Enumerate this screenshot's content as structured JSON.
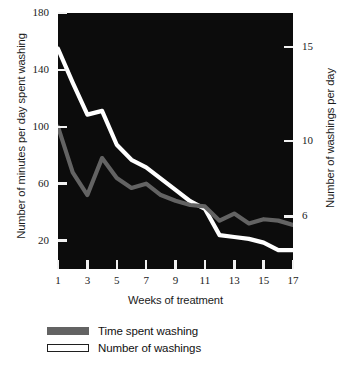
{
  "chart_data": {
    "type": "line",
    "title": "",
    "xlabel": "Weeks of treatment",
    "ylabel": "Number of minutes per day spent washing",
    "ylabel_right": "Number of washings per day",
    "grid": false,
    "legend_position": "bottom-left",
    "background": "#0c0c0c",
    "x": [
      1,
      2,
      3,
      4,
      5,
      6,
      7,
      8,
      9,
      10,
      11,
      12,
      13,
      14,
      15,
      16,
      17
    ],
    "xticks": [
      1,
      3,
      5,
      7,
      9,
      11,
      13,
      15,
      17
    ],
    "xlim": [
      1,
      17
    ],
    "ylim_left": [
      0,
      180
    ],
    "yticks_left": [
      20,
      60,
      100,
      140,
      180
    ],
    "ylim_right": [
      3.2,
      16.8
    ],
    "yticks_right": [
      6,
      10,
      15
    ],
    "series": [
      {
        "name": "Time spent washing",
        "axis": "left",
        "color": "#636363",
        "unit": "minutes per day",
        "values": [
          100,
          68,
          52,
          78,
          64,
          57,
          60,
          52,
          48,
          45,
          44,
          34,
          39,
          32,
          35,
          34,
          31
        ]
      },
      {
        "name": "Number of washings",
        "axis": "right",
        "color": "#ffffff",
        "unit": "washings per day",
        "values": [
          14.9,
          13.1,
          11.4,
          11.6,
          9.8,
          9.0,
          8.6,
          8.0,
          7.4,
          6.8,
          6.4,
          5.0,
          4.9,
          4.8,
          4.6,
          4.2,
          4.2
        ]
      }
    ]
  },
  "axes": {
    "left_title": "Number of minutes per day spent washing",
    "right_title": "Number of washings per day",
    "bottom_title": "Weeks of treatment",
    "left_ticks": [
      "180",
      "140",
      "100",
      "60",
      "20"
    ],
    "right_ticks": [
      "15",
      "10",
      "6"
    ],
    "bottom_ticks": [
      "1",
      "3",
      "5",
      "7",
      "9",
      "11",
      "13",
      "15",
      "17"
    ]
  },
  "legend": {
    "items": [
      {
        "label": "Time spent washing",
        "swatch": "solid-gray"
      },
      {
        "label": "Number of washings",
        "swatch": "hollow-white"
      }
    ]
  }
}
